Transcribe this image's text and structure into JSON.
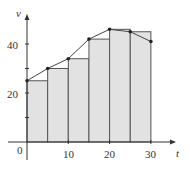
{
  "chart_data": {
    "type": "bar",
    "title": "",
    "xlabel": "t",
    "ylabel": "v",
    "x_ticks": [
      0,
      10,
      20,
      30
    ],
    "y_ticks_labeled": [
      20,
      40
    ],
    "y_ticks_minor": [
      10,
      30
    ],
    "xlim": [
      0,
      33
    ],
    "ylim": [
      0,
      52
    ],
    "grid": false,
    "legend": null,
    "rectangles": {
      "method": "left-endpoint",
      "width": 5,
      "left_edges": [
        0,
        5,
        10,
        15,
        20,
        25
      ],
      "heights": [
        25,
        30,
        34,
        42,
        46,
        45
      ]
    },
    "curve": {
      "type": "line",
      "x": [
        0,
        5,
        10,
        15,
        20,
        25,
        30
      ],
      "y": [
        25,
        30,
        34,
        42,
        46,
        45,
        41
      ]
    },
    "colors": {
      "fill": "#e2e2e2",
      "stroke": "#555555",
      "curve": "#444444",
      "axis": "#333333"
    }
  },
  "labels": {
    "x_axis": "t",
    "y_axis": "v",
    "origin": "0",
    "x_tick_10": "10",
    "x_tick_20": "20",
    "x_tick_30": "30",
    "y_tick_20": "20",
    "y_tick_40": "40"
  }
}
